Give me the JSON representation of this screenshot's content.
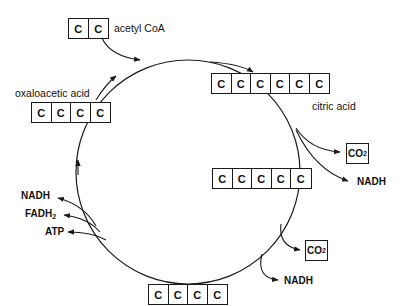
{
  "diagram": {
    "type": "cycle",
    "molecules": {
      "acetyl_coa": {
        "label": "acetyl CoA",
        "cells": [
          "C",
          "C"
        ]
      },
      "citric_acid": {
        "label": "citric acid",
        "cells": [
          "C",
          "C",
          "C",
          "C",
          "C",
          "C"
        ]
      },
      "five_carbon": {
        "cells": [
          "C",
          "C",
          "C",
          "C",
          "C"
        ]
      },
      "four_carbon": {
        "cells": [
          "C",
          "C",
          "C",
          "C"
        ]
      },
      "oxaloacetic_acid": {
        "label": "oxaloacetic acid",
        "cells": [
          "C",
          "C",
          "C",
          "C"
        ]
      }
    },
    "products": {
      "upper_co2": {
        "main": "CO",
        "sub": "2"
      },
      "upper_nadh": "NADH",
      "lower_co2": {
        "main": "CO",
        "sub": "2"
      },
      "lower_nadh": "NADH",
      "left_nadh": "NADH",
      "left_fadh2": {
        "main": "FADH",
        "sub": "2"
      },
      "left_atp": "ATP"
    },
    "colors": {
      "line": "#1a1a1a",
      "background": "#ffffff"
    }
  }
}
